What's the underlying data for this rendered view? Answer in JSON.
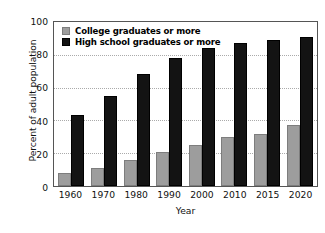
{
  "chart_data": {
    "type": "bar",
    "title": "",
    "xlabel": "Year",
    "ylabel": "Percent of adult population",
    "categories": [
      "1960",
      "1970",
      "1980",
      "1990",
      "2000",
      "2010",
      "2015",
      "2020"
    ],
    "series": [
      {
        "name": "College graduates or more",
        "color": "#9d9d9d",
        "values": [
          8,
          11,
          16,
          21,
          25,
          30,
          32,
          37
        ]
      },
      {
        "name": "High school graduates or more",
        "color": "#131313",
        "values": [
          43,
          55,
          68,
          78,
          84,
          87,
          89,
          91
        ]
      }
    ],
    "ylim": [
      0,
      100
    ],
    "yticks": [
      0,
      20,
      40,
      60,
      80,
      100
    ],
    "grid": "horizontal-dotted",
    "legend_position": "top-left"
  }
}
